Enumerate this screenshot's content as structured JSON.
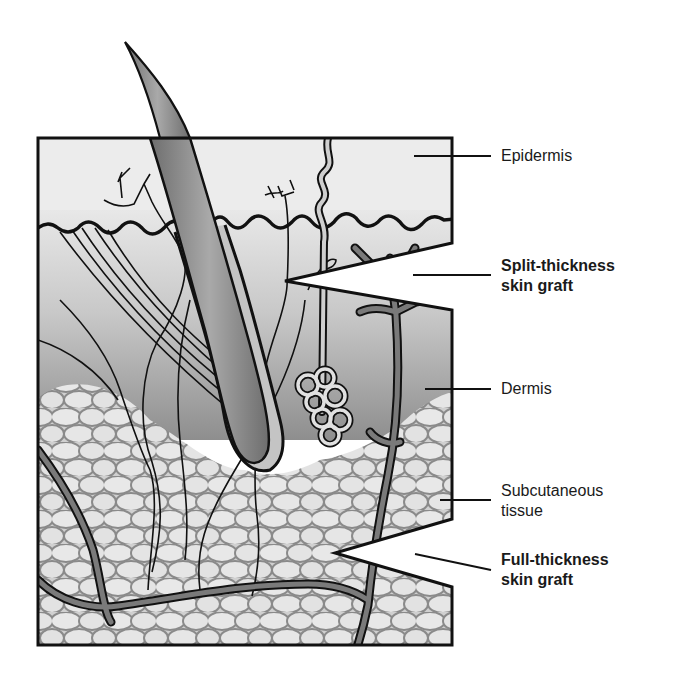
{
  "labels": {
    "epidermis": "Epidermis",
    "split_thickness_line1": "Split-thickness",
    "split_thickness_line2": "skin graft",
    "dermis": "Dermis",
    "subcutaneous_line1": "Subcutaneous",
    "subcutaneous_line2": "tissue",
    "full_thickness_line1": "Full-thickness",
    "full_thickness_line2": "skin graft"
  },
  "colors": {
    "outline": "#111111",
    "epidermis_fill": "#ececec",
    "dermis_top": "#d9d9d9",
    "dermis_bottom": "#8c8c8c",
    "fat_fill": "#e6e6e6",
    "fat_stroke": "#8a8a8a",
    "vessel": "#777777",
    "hair": "#8a8a8a"
  }
}
